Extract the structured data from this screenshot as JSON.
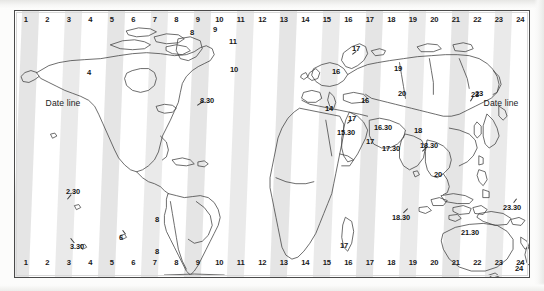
{
  "figure": {
    "type": "map"
  },
  "dateline": {
    "left_label": "Date line",
    "right_label": "Date line"
  },
  "hour_rail": {
    "top": [
      "1",
      "2",
      "3",
      "4",
      "5",
      "6",
      "7",
      "8",
      "9",
      "10",
      "11",
      "12",
      "13",
      "14",
      "15",
      "16",
      "17",
      "18",
      "19",
      "20",
      "21",
      "22",
      "23",
      "24"
    ],
    "bottom": [
      "1",
      "2",
      "3",
      "4",
      "5",
      "6",
      "7",
      "8",
      "9",
      "10",
      "11",
      "12",
      "13",
      "14",
      "15",
      "16",
      "17",
      "18",
      "19",
      "20",
      "21",
      "22",
      "23",
      "24"
    ]
  },
  "zone_labels": [
    {
      "id": "na-mountain",
      "text": "4",
      "x": 88,
      "y": 71,
      "leader": null
    },
    {
      "id": "greenland-west",
      "text": "8",
      "x": 191,
      "y": 31,
      "leader": null
    },
    {
      "id": "greenland-mid",
      "text": "9",
      "x": 214,
      "y": 28,
      "leader": null
    },
    {
      "id": "greenland-east",
      "text": "11",
      "x": 232,
      "y": 40,
      "leader": null
    },
    {
      "id": "iceland",
      "text": "10",
      "x": 233,
      "y": 68,
      "leader": null
    },
    {
      "id": "newfoundland",
      "text": "8.30",
      "x": 206,
      "y": 99,
      "leader": {
        "x1": 196,
        "y1": 104,
        "x2": 202,
        "y2": 100
      }
    },
    {
      "id": "scandinavia",
      "text": "17",
      "x": 355,
      "y": 47,
      "leader": {
        "x1": 351,
        "y1": 53,
        "x2": 355,
        "y2": 50
      }
    },
    {
      "id": "baltic",
      "text": "16",
      "x": 335,
      "y": 70,
      "leader": null
    },
    {
      "id": "russia-central",
      "text": "19",
      "x": 397,
      "y": 67,
      "leader": null
    },
    {
      "id": "russia-east",
      "text": "20",
      "x": 401,
      "y": 92,
      "leader": null
    },
    {
      "id": "korea-japan",
      "text": "23",
      "x": 474,
      "y": 93,
      "leader": {
        "x1": 469,
        "y1": 100,
        "x2": 472,
        "y2": 95
      }
    },
    {
      "id": "turkey",
      "text": "14",
      "x": 328,
      "y": 107,
      "leader": null
    },
    {
      "id": "caucasus",
      "text": "16",
      "x": 364,
      "y": 99,
      "leader": null
    },
    {
      "id": "caspian",
      "text": "17",
      "x": 351,
      "y": 117,
      "leader": {
        "x1": 346,
        "y1": 122,
        "x2": 350,
        "y2": 119
      }
    },
    {
      "id": "iran",
      "text": "16.30",
      "x": 382,
      "y": 126,
      "leader": null
    },
    {
      "id": "arabia",
      "text": "15.30",
      "x": 345,
      "y": 131,
      "leader": null
    },
    {
      "id": "gulf",
      "text": "17",
      "x": 369,
      "y": 140,
      "leader": null
    },
    {
      "id": "india",
      "text": "17.30",
      "x": 390,
      "y": 147,
      "leader": null
    },
    {
      "id": "china",
      "text": "18",
      "x": 417,
      "y": 129,
      "leader": null
    },
    {
      "id": "burma",
      "text": "18.30",
      "x": 428,
      "y": 144,
      "leader": {
        "x1": 421,
        "y1": 150,
        "x2": 425,
        "y2": 146
      }
    },
    {
      "id": "indochina",
      "text": "20",
      "x": 437,
      "y": 173,
      "leader": null
    },
    {
      "id": "pacific-ne",
      "text": "23",
      "x": 478,
      "y": 92,
      "leader": null
    },
    {
      "id": "s-america-n",
      "text": "6",
      "x": 120,
      "y": 236,
      "leader": {
        "x1": 122,
        "y1": 229,
        "x2": 125,
        "y2": 233
      }
    },
    {
      "id": "s-america-e",
      "text": "8",
      "x": 156,
      "y": 218,
      "leader": null
    },
    {
      "id": "s-america-se",
      "text": "8",
      "x": 156,
      "y": 250,
      "leader": null
    },
    {
      "id": "pacific-marquesas",
      "text": "2.30",
      "x": 72,
      "y": 190,
      "leader": {
        "x1": 66,
        "y1": 198,
        "x2": 70,
        "y2": 193
      }
    },
    {
      "id": "pacific-south",
      "text": "3.30",
      "x": 76,
      "y": 245,
      "leader": {
        "x1": 70,
        "y1": 237,
        "x2": 74,
        "y2": 242
      }
    },
    {
      "id": "south-africa",
      "text": "17",
      "x": 343,
      "y": 244,
      "leader": null
    },
    {
      "id": "indian-ocean",
      "text": "18.30",
      "x": 400,
      "y": 216,
      "leader": {
        "x1": 407,
        "y1": 208,
        "x2": 403,
        "y2": 212
      }
    },
    {
      "id": "australia-central",
      "text": "21.30",
      "x": 469,
      "y": 231,
      "leader": null
    },
    {
      "id": "new-zealand",
      "text": "23.30",
      "x": 511,
      "y": 206,
      "leader": {
        "x1": 516,
        "y1": 198,
        "x2": 513,
        "y2": 202
      }
    },
    {
      "id": "pacific-chatham",
      "text": "24",
      "x": 518,
      "y": 267,
      "leader": {
        "x1": 522,
        "y1": 260,
        "x2": 519,
        "y2": 264
      }
    }
  ],
  "colors": {
    "frame_border": "#4a4a4a",
    "stripe_fill": "#dcdcdc",
    "coastline": "#3c3c3c",
    "label_text": "#161616",
    "page_background": "#fdfdfc"
  }
}
